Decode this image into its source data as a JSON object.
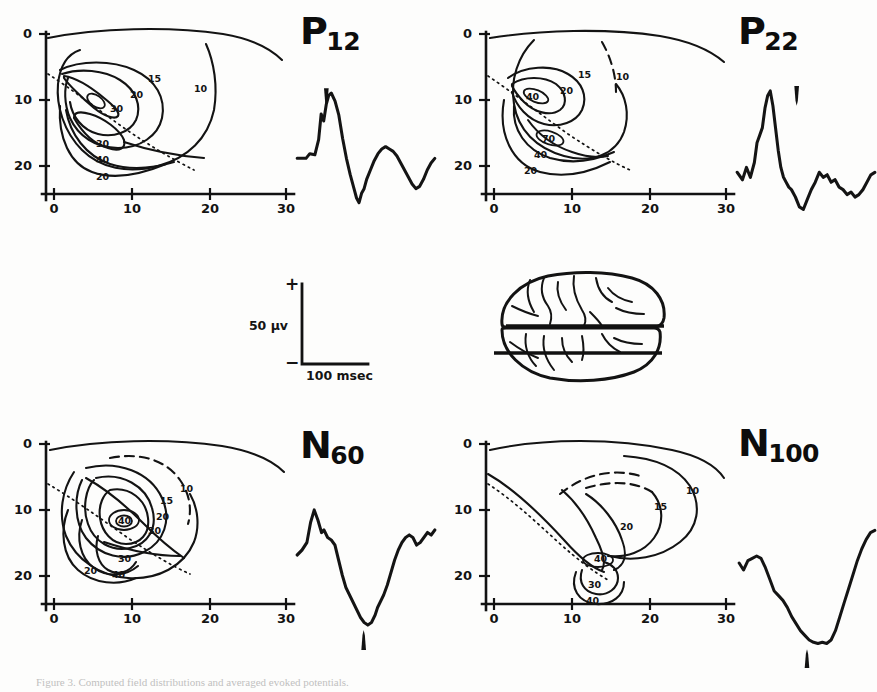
{
  "figure": {
    "caption": "Figure 3. Computed field distributions and averaged evoked potentials.",
    "background_color": "#fdfdfc",
    "ink_color": "#131313"
  },
  "chart_data": {
    "type": "line",
    "panel_layout": "2x2 grid; each cell = isopotential contour map (left) + evoked potential trace (right)",
    "shared_map_axes": {
      "xlabel": "",
      "ylabel": "",
      "x_ticks": [
        0,
        10,
        20,
        30
      ],
      "y_ticks": [
        0,
        10,
        20
      ],
      "xlim": [
        -5,
        33
      ],
      "ylim": [
        0,
        25
      ],
      "grid": false,
      "y_direction": "downward (depth)"
    },
    "trace_scale": {
      "vertical_label": "50 µv",
      "horizontal_label": "100 msec",
      "positive_sign": "+",
      "negative_sign": "−"
    },
    "panels": [
      {
        "id": "p12",
        "label_base": "P",
        "label_sub": "12",
        "label_full": "P12",
        "polarity": "positive",
        "contour_levels": [
          10,
          15,
          20,
          30,
          40
        ],
        "contour_labels": [
          "10",
          "15",
          "20",
          "30",
          "30",
          "40",
          "20"
        ],
        "peak_level": 40,
        "peak_location": [
          5,
          10
        ],
        "trace_description": "sharp positive peak with notch, deep negative trough, broad positive rebound",
        "arrow_position": "above peak",
        "trace_points": [
          [
            0,
            62
          ],
          [
            7,
            62
          ],
          [
            10,
            58
          ],
          [
            14,
            59
          ],
          [
            17,
            46
          ],
          [
            19,
            24
          ],
          [
            21,
            30
          ],
          [
            23,
            16
          ],
          [
            25,
            8
          ],
          [
            27,
            6
          ],
          [
            30,
            13
          ],
          [
            33,
            25
          ],
          [
            36,
            45
          ],
          [
            39,
            62
          ],
          [
            42,
            76
          ],
          [
            45,
            88
          ],
          [
            47,
            96
          ],
          [
            49,
            100
          ],
          [
            51,
            92
          ],
          [
            53,
            88
          ],
          [
            55,
            80
          ],
          [
            58,
            72
          ],
          [
            61,
            64
          ],
          [
            64,
            58
          ],
          [
            67,
            54
          ],
          [
            70,
            52
          ],
          [
            73,
            54
          ],
          [
            76,
            56
          ],
          [
            79,
            60
          ],
          [
            82,
            66
          ],
          [
            85,
            72
          ],
          [
            88,
            78
          ],
          [
            91,
            84
          ],
          [
            94,
            88
          ],
          [
            97,
            86
          ],
          [
            100,
            80
          ],
          [
            103,
            72
          ],
          [
            106,
            66
          ],
          [
            109,
            62
          ]
        ]
      },
      {
        "id": "p22",
        "label_base": "P",
        "label_sub": "22",
        "label_full": "P22",
        "polarity": "positive",
        "contour_levels": [
          10,
          15,
          20,
          30,
          40,
          70
        ],
        "contour_labels": [
          "10",
          "15",
          "20",
          "40",
          "70",
          "40",
          "20"
        ],
        "peak_level": 70,
        "peak_location": [
          6,
          10
        ],
        "trace_description": "tall sharp positive peak then deep trough with noisy recovery",
        "arrow_position": "above peak",
        "trace_points": [
          [
            0,
            70
          ],
          [
            4,
            76
          ],
          [
            7,
            66
          ],
          [
            10,
            74
          ],
          [
            13,
            62
          ],
          [
            15,
            46
          ],
          [
            17,
            40
          ],
          [
            19,
            34
          ],
          [
            21,
            18
          ],
          [
            23,
            8
          ],
          [
            25,
            4
          ],
          [
            27,
            16
          ],
          [
            29,
            34
          ],
          [
            31,
            52
          ],
          [
            33,
            66
          ],
          [
            35,
            74
          ],
          [
            37,
            78
          ],
          [
            39,
            82
          ],
          [
            41,
            84
          ],
          [
            44,
            90
          ],
          [
            47,
            98
          ],
          [
            50,
            100
          ],
          [
            53,
            92
          ],
          [
            56,
            84
          ],
          [
            59,
            78
          ],
          [
            62,
            70
          ],
          [
            65,
            74
          ],
          [
            68,
            72
          ],
          [
            71,
            78
          ],
          [
            74,
            76
          ],
          [
            77,
            82
          ],
          [
            80,
            84
          ],
          [
            83,
            88
          ],
          [
            86,
            86
          ],
          [
            89,
            90
          ],
          [
            92,
            88
          ],
          [
            95,
            84
          ],
          [
            98,
            78
          ],
          [
            101,
            72
          ],
          [
            104,
            70
          ]
        ]
      },
      {
        "id": "n60",
        "label_base": "N",
        "label_sub": "60",
        "label_full": "N60",
        "polarity": "negative",
        "contour_levels": [
          10,
          15,
          20,
          30,
          40
        ],
        "contour_labels": [
          "10",
          "15",
          "20",
          "30",
          "40",
          "30",
          "40",
          "20"
        ],
        "peak_level": 40,
        "peak_location": [
          11,
          13
        ],
        "trace_description": "initial positive peak then deep V-shaped negative trough, slow recovery",
        "arrow_position": "below trough",
        "trace_points": [
          [
            0,
            44
          ],
          [
            4,
            40
          ],
          [
            8,
            34
          ],
          [
            11,
            18
          ],
          [
            14,
            8
          ],
          [
            17,
            16
          ],
          [
            20,
            26
          ],
          [
            22,
            24
          ],
          [
            25,
            30
          ],
          [
            28,
            32
          ],
          [
            31,
            36
          ],
          [
            34,
            48
          ],
          [
            37,
            60
          ],
          [
            40,
            70
          ],
          [
            43,
            76
          ],
          [
            46,
            82
          ],
          [
            49,
            88
          ],
          [
            52,
            94
          ],
          [
            55,
            98
          ],
          [
            58,
            100
          ],
          [
            61,
            98
          ],
          [
            64,
            92
          ],
          [
            66,
            86
          ],
          [
            69,
            80
          ],
          [
            71,
            76
          ],
          [
            74,
            68
          ],
          [
            77,
            58
          ],
          [
            80,
            48
          ],
          [
            83,
            40
          ],
          [
            86,
            34
          ],
          [
            89,
            30
          ],
          [
            92,
            28
          ],
          [
            95,
            30
          ],
          [
            98,
            36
          ],
          [
            101,
            34
          ],
          [
            104,
            30
          ],
          [
            107,
            26
          ],
          [
            110,
            28
          ],
          [
            113,
            24
          ]
        ]
      },
      {
        "id": "n100",
        "label_base": "N",
        "label_sub": "100",
        "label_full": "N100",
        "polarity": "negative",
        "contour_levels": [
          10,
          15,
          20,
          30,
          40
        ],
        "contour_labels": [
          "10",
          "15",
          "20",
          "40",
          "30",
          "40"
        ],
        "peak_level": 40,
        "peak_location": [
          15,
          18
        ],
        "trace_description": "broad U-shaped negative deflection with steep positive recovery",
        "arrow_position": "below trough",
        "trace_points": [
          [
            0,
            30
          ],
          [
            3,
            36
          ],
          [
            6,
            28
          ],
          [
            9,
            26
          ],
          [
            12,
            24
          ],
          [
            15,
            26
          ],
          [
            18,
            34
          ],
          [
            21,
            44
          ],
          [
            24,
            54
          ],
          [
            27,
            58
          ],
          [
            30,
            62
          ],
          [
            33,
            68
          ],
          [
            36,
            76
          ],
          [
            39,
            82
          ],
          [
            42,
            88
          ],
          [
            45,
            92
          ],
          [
            48,
            96
          ],
          [
            51,
            98
          ],
          [
            54,
            99
          ],
          [
            57,
            98
          ],
          [
            60,
            99
          ],
          [
            63,
            96
          ],
          [
            66,
            88
          ],
          [
            69,
            76
          ],
          [
            72,
            64
          ],
          [
            75,
            52
          ],
          [
            78,
            40
          ],
          [
            81,
            28
          ],
          [
            84,
            18
          ],
          [
            87,
            10
          ],
          [
            90,
            4
          ],
          [
            93,
            2
          ]
        ]
      }
    ],
    "brain_diagram": {
      "view": "dorsal",
      "section_lines": 2,
      "description": "schematic brain with two horizontal section-level lines"
    }
  }
}
